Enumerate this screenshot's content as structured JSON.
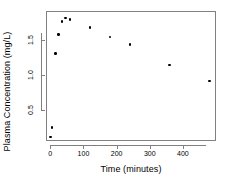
{
  "chart_data": {
    "type": "scatter",
    "title": "",
    "xlabel": "Time (minutes)",
    "ylabel": "Plasma Concentration (mg/L)",
    "xlim": [
      -13,
      500
    ],
    "ylim": [
      0.06,
      1.92
    ],
    "xticks": [
      0,
      100,
      200,
      300,
      400
    ],
    "xticklabels": [
      "0",
      "100",
      "200",
      "300",
      "400"
    ],
    "yticks": [
      0.5,
      1.0,
      1.5
    ],
    "yticklabels": [
      "0.5",
      "1.0",
      "1.5"
    ],
    "grid": false,
    "legend": false,
    "marker": "filled-circle",
    "marker_color": "#000000",
    "frame": true,
    "x": [
      0,
      5,
      15,
      25,
      35,
      45,
      60,
      120,
      180,
      240,
      360,
      480
    ],
    "y": [
      0.12,
      0.25,
      1.31,
      1.58,
      1.77,
      1.82,
      1.8,
      1.68,
      1.55,
      1.44,
      1.15,
      0.92
    ],
    "points": [
      {
        "x": 0,
        "y": 0.12
      },
      {
        "x": 5,
        "y": 0.25
      },
      {
        "x": 15,
        "y": 1.31
      },
      {
        "x": 25,
        "y": 1.58
      },
      {
        "x": 35,
        "y": 1.77
      },
      {
        "x": 45,
        "y": 1.82
      },
      {
        "x": 60,
        "y": 1.8
      },
      {
        "x": 120,
        "y": 1.68
      },
      {
        "x": 180,
        "y": 1.55
      },
      {
        "x": 240,
        "y": 1.44
      },
      {
        "x": 360,
        "y": 1.15
      },
      {
        "x": 480,
        "y": 0.92
      }
    ]
  },
  "axes": {
    "x_title": "Time (minutes)",
    "y_title": "Plasma Concentration (mg/L)",
    "axis_color": "#808080"
  }
}
